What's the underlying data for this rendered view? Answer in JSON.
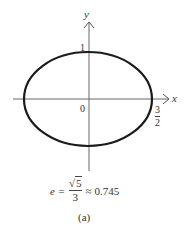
{
  "figure": {
    "axes": {
      "x_label": "x",
      "y_label": "y",
      "origin_label": "0",
      "y_intercept_label": "1",
      "x_intercept_label": {
        "numerator": "3",
        "denominator": "2"
      }
    },
    "curve": {
      "type": "ellipse",
      "semi_major_x": "3/2",
      "semi_minor_y": "1"
    },
    "equation": {
      "lhs": "e =",
      "sqrt_symbol": "√",
      "radicand": "5",
      "denominator": "3",
      "approx": "≈ 0.745"
    },
    "caption": "(a)"
  },
  "colors": {
    "curve": "#1a1a1a",
    "axes": "#555555",
    "text": "#333333"
  }
}
